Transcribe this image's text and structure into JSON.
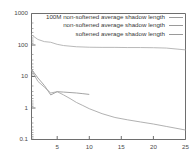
{
  "chart_data": {
    "type": "line",
    "title": "",
    "xlabel": "",
    "ylabel": "",
    "yscale": "log",
    "xscale": "linear",
    "xlim": [
      1,
      25
    ],
    "ylim": [
      0.1,
      1000
    ],
    "grid": false,
    "legend_position": "top-right",
    "xticks": [
      "5",
      "10",
      "15",
      "20",
      "25"
    ],
    "xtick_values": [
      5,
      10,
      15,
      20,
      25
    ],
    "yticks": [
      "1000",
      "100",
      "10",
      "1",
      "0.1"
    ],
    "ytick_values": [
      1000,
      100,
      10,
      1,
      0.1
    ],
    "series": [
      {
        "name": "100M non-softened average shadow length",
        "color": "#9a9a9a",
        "x": [
          1,
          2,
          3,
          4,
          5,
          6,
          7,
          8,
          9,
          10
        ],
        "values": [
          17.0,
          9.0,
          5.2,
          2.6,
          3.3,
          3.2,
          3.1,
          3.0,
          2.85,
          2.7
        ]
      },
      {
        "name": "non-softened average shadow length",
        "color": "#a8a8a8",
        "x": [
          1,
          2,
          3,
          4,
          5,
          6,
          7,
          8,
          9,
          10,
          12,
          14,
          16,
          18,
          20,
          22,
          25
        ],
        "values": [
          16.0,
          7.0,
          4.6,
          3.0,
          3.3,
          2.6,
          2.0,
          1.5,
          1.2,
          0.95,
          0.66,
          0.5,
          0.42,
          0.36,
          0.31,
          0.26,
          0.2
        ]
      },
      {
        "name": "softened average shadow length",
        "color": "#b0b0b0",
        "x": [
          1,
          2,
          3,
          4,
          5,
          6,
          8,
          10,
          12,
          14,
          16,
          18,
          20,
          22,
          25
        ],
        "values": [
          210,
          150,
          128,
          122,
          105,
          96,
          88,
          85,
          84,
          84,
          83,
          83,
          82,
          80,
          70
        ]
      }
    ]
  },
  "legend": {
    "entries": [
      "100M non-softened average shadow length",
      "non-softened average shadow length",
      "softened average shadow length"
    ]
  },
  "colors": {
    "axis": "#6e6e6e",
    "text": "#4a4a4a",
    "line": "#9a9a9a",
    "background": "#ffffff"
  }
}
